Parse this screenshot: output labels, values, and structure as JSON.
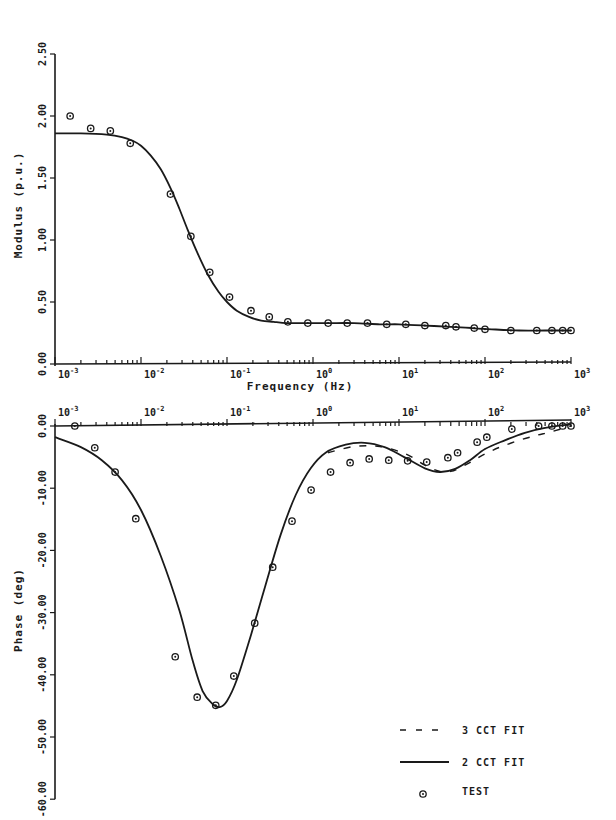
{
  "chart_data": [
    {
      "type": "line",
      "title": "",
      "xlabel": "Frequency (Hz)",
      "ylabel": "Modulus (p.u.)",
      "xscale": "log",
      "xlim": [
        0.001,
        1000
      ],
      "ylim": [
        0.0,
        2.5
      ],
      "x_ticks": [
        "10^-3",
        "10^-2",
        "10^-1",
        "10^0",
        "10^1",
        "10^2",
        "10^3"
      ],
      "y_ticks": [
        "0.00",
        "0.50",
        "1.00",
        "1.50",
        "2.00",
        "2.50"
      ],
      "grid": false,
      "series": [
        {
          "name": "2 CCT FIT",
          "style": "solid",
          "x": [
            0.001,
            0.002,
            0.004,
            0.006,
            0.008,
            0.01,
            0.013,
            0.017,
            0.022,
            0.028,
            0.035,
            0.045,
            0.06,
            0.08,
            0.1,
            0.13,
            0.18,
            0.25,
            0.35,
            0.5,
            0.8,
            1.5,
            3,
            6,
            10,
            20,
            40,
            70,
            120,
            250,
            500,
            1000
          ],
          "y": [
            1.86,
            1.86,
            1.85,
            1.83,
            1.8,
            1.76,
            1.68,
            1.57,
            1.42,
            1.25,
            1.08,
            0.9,
            0.72,
            0.58,
            0.5,
            0.43,
            0.38,
            0.35,
            0.34,
            0.33,
            0.33,
            0.33,
            0.33,
            0.32,
            0.32,
            0.31,
            0.3,
            0.29,
            0.28,
            0.27,
            0.27,
            0.27
          ]
        },
        {
          "name": "TEST",
          "style": "marker",
          "x": [
            0.0015,
            0.0026,
            0.0044,
            0.0075,
            0.022,
            0.038,
            0.063,
            0.107,
            0.19,
            0.31,
            0.51,
            0.87,
            1.5,
            2.5,
            4.3,
            7.2,
            12,
            20,
            35,
            46,
            75,
            100,
            200,
            400,
            600,
            800,
            1000
          ],
          "y": [
            2.0,
            1.9,
            1.88,
            1.78,
            1.37,
            1.03,
            0.74,
            0.54,
            0.43,
            0.38,
            0.34,
            0.33,
            0.33,
            0.33,
            0.33,
            0.32,
            0.32,
            0.31,
            0.31,
            0.3,
            0.29,
            0.28,
            0.27,
            0.27,
            0.27,
            0.27,
            0.27
          ]
        }
      ]
    },
    {
      "type": "line",
      "title": "",
      "xlabel": "",
      "ylabel": "Phase (deg)",
      "xscale": "log",
      "xlim": [
        0.001,
        1000
      ],
      "ylim": [
        -60.0,
        0.0
      ],
      "x_ticks": [
        "10^-3",
        "10^-2",
        "10^-1",
        "10^0",
        "10^1",
        "10^2",
        "10^3"
      ],
      "y_ticks": [
        "0.00",
        "-10.00",
        "-20.00",
        "-30.00",
        "-40.00",
        "-50.00",
        "-60.00"
      ],
      "grid": false,
      "series": [
        {
          "name": "3 CCT FIT",
          "style": "dashed",
          "x": [
            1.5,
            3,
            6,
            12,
            20,
            30,
            40,
            50,
            70,
            100,
            150,
            250,
            400,
            600,
            1000
          ],
          "y": [
            -4.3,
            -3.3,
            -3.3,
            -4.5,
            -6.3,
            -7.3,
            -7.3,
            -6.8,
            -5.7,
            -4.5,
            -3.4,
            -2.3,
            -1.5,
            -0.9,
            0.0
          ]
        },
        {
          "name": "2 CCT FIT",
          "style": "solid",
          "x": [
            0.001,
            0.002,
            0.0035,
            0.006,
            0.01,
            0.017,
            0.028,
            0.04,
            0.052,
            0.068,
            0.082,
            0.1,
            0.13,
            0.19,
            0.28,
            0.42,
            0.63,
            0.94,
            1.4,
            2.4,
            4.0,
            6.8,
            11.5,
            20,
            30,
            45,
            67,
            100,
            170,
            290,
            500,
            1000
          ],
          "y": [
            -1.8,
            -3.4,
            -5.5,
            -8.7,
            -13.5,
            -20.9,
            -29.7,
            -37.8,
            -42.6,
            -44.7,
            -45.2,
            -44.2,
            -40.8,
            -33.6,
            -25.6,
            -17.5,
            -11.1,
            -6.8,
            -4.3,
            -3.0,
            -2.7,
            -3.4,
            -5.0,
            -6.8,
            -7.4,
            -6.9,
            -5.5,
            -3.7,
            -2.3,
            -1.1,
            -0.3,
            0.3
          ]
        },
        {
          "name": "TEST",
          "style": "marker",
          "x": [
            0.0017,
            0.0029,
            0.005,
            0.0087,
            0.025,
            0.045,
            0.074,
            0.12,
            0.21,
            0.34,
            0.57,
            0.95,
            1.6,
            2.7,
            4.5,
            7.6,
            12.6,
            21,
            37,
            48,
            81,
            105,
            205,
            420,
            600,
            800,
            1000
          ],
          "y": [
            0.0,
            -3.5,
            -7.4,
            -14.9,
            -37.1,
            -43.6,
            -44.9,
            -40.2,
            -31.7,
            -22.7,
            -15.3,
            -10.3,
            -7.4,
            -5.9,
            -5.3,
            -5.5,
            -5.6,
            -5.8,
            -5.1,
            -4.3,
            -2.6,
            -1.8,
            -0.5,
            0.0,
            0.0,
            0.0,
            0.0
          ]
        }
      ]
    }
  ],
  "legend": {
    "items": [
      {
        "label": "3 CCT FIT",
        "style": "dashed"
      },
      {
        "label": "2 CCT FIT",
        "style": "solid"
      },
      {
        "label": "TEST",
        "style": "marker"
      }
    ]
  },
  "labels": {
    "mag_ylabel": "Modulus (p.u.)",
    "phase_ylabel": "Phase (deg)",
    "xlabel": "Frequency (Hz)",
    "decades": [
      "-3",
      "-2",
      "-1",
      "0",
      "1",
      "2",
      "3"
    ]
  },
  "colors": {
    "ink": "#1a1a1a",
    "paper": "#ffffff"
  }
}
